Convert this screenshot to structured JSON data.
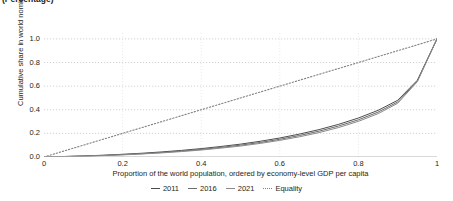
{
  "unit_note": "(Percentage)",
  "chart_data": {
    "type": "line",
    "title": "",
    "unit_note": "(Percentage)",
    "xlabel": "Proportion of the world population, ordered by economy-level GDP per capita",
    "ylabel": "Cumulative share in world nominal GDP",
    "xlim": [
      0,
      1
    ],
    "ylim": [
      0,
      1.05
    ],
    "xticks": [
      0,
      0.2,
      0.4,
      0.6,
      0.8,
      1
    ],
    "xticklabels": [
      "0",
      "0.2",
      "0.4",
      "0.6",
      "0.8",
      "1"
    ],
    "yticks": [
      0,
      0.2,
      0.4,
      0.6,
      0.8,
      1
    ],
    "yticklabels": [
      "0.0",
      "0.2",
      "0.4",
      "0.6",
      "0.8",
      "1.0"
    ],
    "grid": "horizontal-dotted",
    "legend_position": "bottom-center",
    "x": [
      0,
      0.05,
      0.1,
      0.15,
      0.2,
      0.25,
      0.3,
      0.35,
      0.4,
      0.45,
      0.5,
      0.55,
      0.6,
      0.65,
      0.7,
      0.75,
      0.8,
      0.85,
      0.9,
      0.95,
      1
    ],
    "series": [
      {
        "name": "2011",
        "color": "#4d4d4d",
        "style": "solid",
        "values": [
          0,
          0.004,
          0.009,
          0.015,
          0.023,
          0.032,
          0.043,
          0.056,
          0.071,
          0.089,
          0.109,
          0.133,
          0.161,
          0.194,
          0.232,
          0.277,
          0.33,
          0.395,
          0.48,
          0.65,
          1.0
        ]
      },
      {
        "name": "2016",
        "color": "#6b6b6b",
        "style": "solid",
        "values": [
          0,
          0.004,
          0.008,
          0.013,
          0.02,
          0.028,
          0.038,
          0.05,
          0.064,
          0.081,
          0.1,
          0.123,
          0.15,
          0.182,
          0.219,
          0.263,
          0.315,
          0.38,
          0.466,
          0.643,
          1.0
        ]
      },
      {
        "name": "2021",
        "color": "#8a8a8a",
        "style": "solid",
        "values": [
          0,
          0.003,
          0.007,
          0.012,
          0.018,
          0.026,
          0.035,
          0.046,
          0.059,
          0.075,
          0.093,
          0.115,
          0.141,
          0.171,
          0.207,
          0.25,
          0.302,
          0.367,
          0.455,
          0.638,
          1.0
        ]
      },
      {
        "name": "Equality",
        "color": "#808080",
        "style": "dotted",
        "values": [
          0,
          0.05,
          0.1,
          0.15,
          0.2,
          0.25,
          0.3,
          0.35,
          0.4,
          0.45,
          0.5,
          0.55,
          0.6,
          0.65,
          0.7,
          0.75,
          0.8,
          0.85,
          0.9,
          0.95,
          1.0
        ]
      }
    ]
  },
  "legend": [
    {
      "label": "2011",
      "color": "#4d4d4d",
      "style": "solid"
    },
    {
      "label": "2016",
      "color": "#6b6b6b",
      "style": "solid"
    },
    {
      "label": "2021",
      "color": "#8a8a8a",
      "style": "solid"
    },
    {
      "label": "Equality",
      "color": "#808080",
      "style": "dotted"
    }
  ],
  "colors": {
    "axis": "#b3b3b3",
    "grid": "#c8c8c8",
    "text": "#231f20",
    "background": "#ffffff"
  }
}
